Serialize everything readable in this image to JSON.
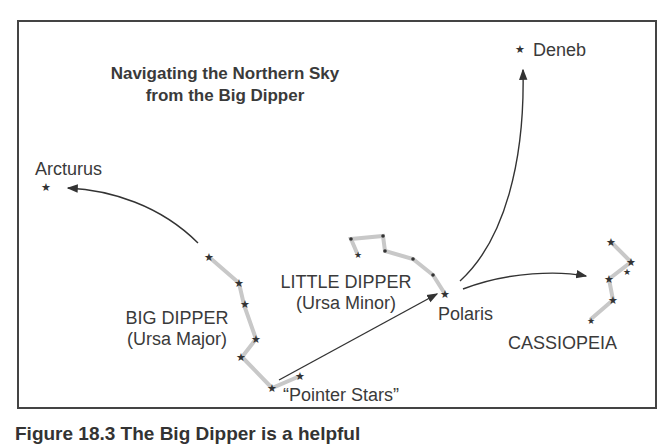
{
  "diagram": {
    "title_line1": "Navigating the Northern Sky",
    "title_line2": "from the Big Dipper",
    "labels": {
      "deneb": "Deneb",
      "arcturus": "Arcturus",
      "big_dipper": "BIG DIPPER",
      "big_dipper_latin": "(Ursa Major)",
      "little_dipper": "LITTLE DIPPER",
      "little_dipper_latin": "(Ursa Minor)",
      "polaris": "Polaris",
      "cassiopeia": "CASSIOPEIA",
      "pointer_stars": "“Pointer Stars”"
    },
    "colors": {
      "border": "#444444",
      "text": "#3a3a3a",
      "constellation_line": "#c8c8c8",
      "arrow": "#333333",
      "star": "#333333"
    }
  },
  "caption": {
    "text": "Figure 18.3 The Big Dipper is a helpful"
  }
}
